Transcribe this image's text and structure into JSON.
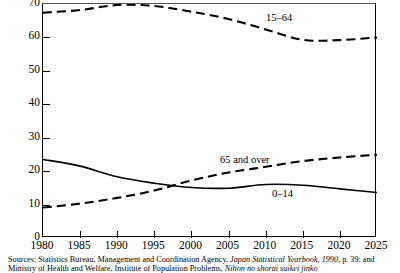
{
  "chart_data": {
    "type": "line",
    "title": "",
    "xlabel": "",
    "ylabel": "",
    "xlim": [
      1980,
      2025
    ],
    "ylim": [
      0,
      70
    ],
    "grid": false,
    "legend_position": "inline-annotations",
    "x_ticks": [
      1980,
      1985,
      1990,
      1995,
      2000,
      2005,
      2010,
      2015,
      2020,
      2025
    ],
    "y_ticks": [
      0,
      10,
      20,
      30,
      40,
      50,
      60,
      70
    ],
    "x": [
      1980,
      1985,
      1990,
      1995,
      2000,
      2005,
      2010,
      2015,
      2020,
      2025
    ],
    "series": [
      {
        "name": "15–64",
        "style": "dashed",
        "label": "15–64",
        "values": [
          67.4,
          68.2,
          69.7,
          69.4,
          67.7,
          65.5,
          62.4,
          59.3,
          59.2,
          60.0
        ]
      },
      {
        "name": "65 and over",
        "style": "dashed",
        "label": "65 and over",
        "values": [
          9.1,
          10.3,
          12.0,
          14.2,
          17.2,
          19.6,
          21.3,
          23.0,
          24.1,
          24.9
        ]
      },
      {
        "name": "0–14",
        "style": "solid",
        "label": "0–14",
        "values": [
          23.5,
          21.5,
          18.3,
          16.4,
          15.1,
          14.9,
          16.0,
          15.8,
          14.7,
          13.6
        ]
      }
    ]
  },
  "annotations": {
    "series_15_64": "15–64",
    "series_65_over": "65 and over",
    "series_0_14": "0–14"
  },
  "source": {
    "line1_prefix": "Sources: Statistics Bureau, Management and Coordination Agency, ",
    "line1_italic": "Japan Statistical Yearbook, 1990",
    "line1_suffix": ", p. 39; and",
    "line2_prefix": "Ministry of Health and Welfare, Institute of Population Problems, ",
    "line2_italic": "Nihon no shorai suikei jinko"
  }
}
